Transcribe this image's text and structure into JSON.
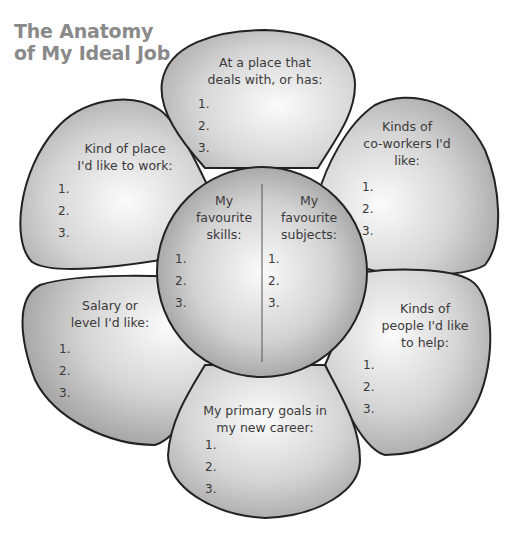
{
  "title": {
    "line1": "The Anatomy",
    "line2": "of My Ideal Job"
  },
  "petals": {
    "top": {
      "heading_lines": [
        "At a place that",
        "deals with, or has:"
      ],
      "items": [
        "1.",
        "2.",
        "3."
      ]
    },
    "upper_left": {
      "heading_lines": [
        "Kind of place",
        "I'd like to work:"
      ],
      "items": [
        "1.",
        "2.",
        "3."
      ]
    },
    "upper_right": {
      "heading_lines": [
        "Kinds of",
        "co-workers I'd",
        "like:"
      ],
      "items": [
        "1.",
        "2.",
        "3."
      ]
    },
    "lower_left": {
      "heading_lines": [
        "Salary or",
        "level I'd like:"
      ],
      "items": [
        "1.",
        "2.",
        "3."
      ]
    },
    "lower_right": {
      "heading_lines": [
        "Kinds of",
        "people I'd like",
        "to help:"
      ],
      "items": [
        "1.",
        "2.",
        "3."
      ]
    },
    "bottom": {
      "heading_lines": [
        "My primary goals in",
        "my new career:"
      ],
      "items": [
        "1.",
        "2.",
        "3."
      ]
    }
  },
  "center": {
    "left": {
      "heading_lines": [
        "My",
        "favourite",
        "skills:"
      ],
      "items": [
        "1.",
        "2.",
        "3."
      ]
    },
    "right": {
      "heading_lines": [
        "My",
        "favourite",
        "subjects:"
      ],
      "items": [
        "1.",
        "2.",
        "3."
      ]
    }
  },
  "colors": {
    "title": "#8a8a8a",
    "petal_fill_light": "#f2f2f2",
    "petal_fill_dark": "#a9a9a9",
    "outline": "#222222",
    "text": "#3a3a3a"
  }
}
